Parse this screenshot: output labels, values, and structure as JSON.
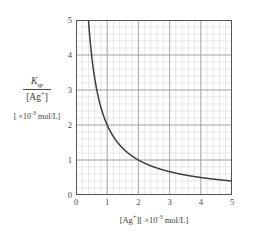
{
  "figure": {
    "background_color": "#ffffff",
    "axis_color": "#555555",
    "major_grid_color": "#9a9a9a",
    "minor_grid_color": "#d8d8d8",
    "curve_color": "#3c3c3c"
  },
  "y_axis": {
    "label_numerator": "K",
    "label_numerator_sub": "sp",
    "label_denominator_open": "[Ag",
    "label_denominator_sup": "+",
    "label_denominator_close": "]",
    "unit_prefix": "[ ×10",
    "unit_exponent": "-3",
    "unit_suffix": " mol/L]",
    "ticks": [
      "0",
      "1",
      "2",
      "3",
      "4",
      "5"
    ],
    "min": 0,
    "max": 5,
    "major_step": 1,
    "minor_step": 0.2
  },
  "x_axis": {
    "label_open": "[Ag",
    "label_sup": "+",
    "label_close": "]",
    "unit_prefix": "[ ×10",
    "unit_exponent": "-3",
    "unit_suffix": " mol/L]",
    "ticks": [
      "0",
      "1",
      "2",
      "3",
      "4",
      "5"
    ],
    "min": 0,
    "max": 5,
    "major_step": 1,
    "minor_step": 0.2
  },
  "chart_data": {
    "type": "line",
    "title": "",
    "xlabel": "[Ag+] ( ×10^-3 mol/L )",
    "ylabel": "Ksp / [Ag+] ( ×10^-3 mol/L )",
    "xlim": [
      0,
      5
    ],
    "ylim": [
      0,
      5
    ],
    "grid": true,
    "major_grid_step": 1,
    "minor_grid_step": 0.2,
    "legend": "none",
    "relation": "y = 2 / x",
    "constant_k": 2,
    "series": [
      {
        "name": "Ksp / [Ag+] vs [Ag+]",
        "x": [
          0.4,
          0.5,
          0.6,
          0.7,
          0.8,
          0.9,
          1.0,
          1.1,
          1.2,
          1.3,
          1.4,
          1.5,
          1.6,
          1.8,
          2.0,
          2.2,
          2.4,
          2.6,
          2.8,
          3.0,
          3.2,
          3.4,
          3.6,
          3.8,
          4.0,
          4.2,
          4.4,
          4.6,
          4.8,
          5.0
        ],
        "y": [
          5.0,
          4.0,
          3.33,
          2.86,
          2.5,
          2.22,
          2.0,
          1.82,
          1.67,
          1.54,
          1.43,
          1.33,
          1.25,
          1.11,
          1.0,
          0.91,
          0.83,
          0.77,
          0.71,
          0.67,
          0.63,
          0.59,
          0.56,
          0.53,
          0.5,
          0.48,
          0.45,
          0.43,
          0.42,
          0.4
        ]
      }
    ]
  }
}
